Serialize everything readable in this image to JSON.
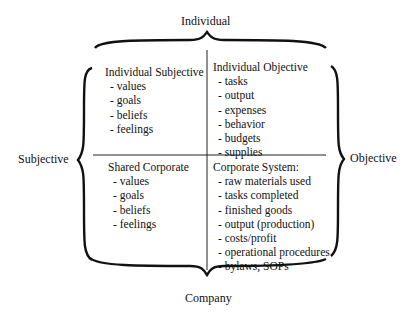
{
  "axes": {
    "top": "Individual",
    "bottom": "Company",
    "left": "Subjective",
    "right": "Objective"
  },
  "quadrants": [
    {
      "position": "top-left",
      "title": "Individual Subjective",
      "items": [
        "- values",
        "- goals",
        "- beliefs",
        "- feelings"
      ]
    },
    {
      "position": "top-right",
      "title": "Individual Objective",
      "items": [
        "- tasks",
        "- output",
        "- expenses",
        "- behavior",
        "- budgets",
        "- supplies"
      ]
    },
    {
      "position": "bottom-left",
      "title": "Shared Corporate",
      "items": [
        "- values",
        "- goals",
        "- beliefs",
        "- feelings"
      ]
    },
    {
      "position": "bottom-right",
      "title": "Corporate System:",
      "items": [
        "- raw materials used",
        "- tasks completed",
        "- finished goods",
        "- output (production)",
        "- costs/profit",
        "- operational procedures",
        "- bylaws, SOPs"
      ]
    }
  ]
}
